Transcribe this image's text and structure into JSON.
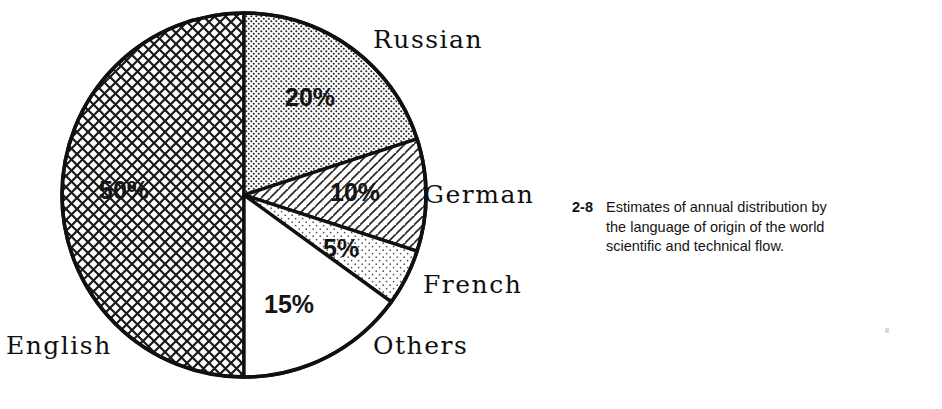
{
  "figure": {
    "caption_number": "2-8",
    "caption_text": "Estimates of annual distribution by the language of origin of the world scientific and technical flow."
  },
  "chart_data": {
    "type": "pie",
    "title": "Estimates of annual distribution by the language of origin of the world scientific and technical flow.",
    "xlabel": "",
    "ylabel": "",
    "legend": "none",
    "grid": false,
    "unit": "%",
    "categories": [
      "English",
      "Russian",
      "German",
      "French",
      "Others"
    ],
    "values": [
      50,
      20,
      10,
      5,
      15
    ],
    "value_labels": [
      "50%",
      "20%",
      "10%",
      "5%",
      "15%"
    ],
    "slices": [
      {
        "name": "English",
        "label": "English",
        "value": 50,
        "value_label": "50%",
        "fill": "crosshatch",
        "fill_color": "#ffffff",
        "line_color": "#101010",
        "start_deg": 180,
        "end_deg": 360
      },
      {
        "name": "Russian",
        "label": "Russian",
        "value": 20,
        "value_label": "20%",
        "fill": "fine-dots",
        "fill_color": "#ffffff",
        "line_color": "#101010",
        "start_deg": 0,
        "end_deg": 72
      },
      {
        "name": "German",
        "label": "German",
        "value": 10,
        "value_label": "10%",
        "fill": "diagonal-hatch",
        "fill_color": "#ffffff",
        "line_color": "#101010",
        "start_deg": 72,
        "end_deg": 108
      },
      {
        "name": "French",
        "label": "French",
        "value": 5,
        "value_label": "5%",
        "fill": "sparse-dots",
        "fill_color": "#ffffff",
        "line_color": "#101010",
        "start_deg": 108,
        "end_deg": 126
      },
      {
        "name": "Others",
        "label": "Others",
        "value": 15,
        "value_label": "15%",
        "fill": "solid-white",
        "fill_color": "#ffffff",
        "line_color": "#101010",
        "start_deg": 126,
        "end_deg": 180
      }
    ],
    "geometry": {
      "center_x": 244,
      "center_y": 195,
      "radius": 182
    },
    "colors": {
      "outline": "#101010",
      "background": "#ffffff",
      "text": "#111111"
    }
  }
}
